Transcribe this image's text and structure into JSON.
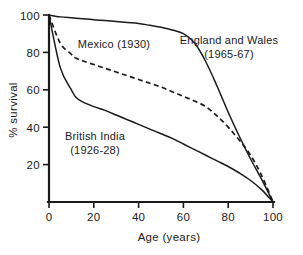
{
  "chart_data": {
    "type": "line",
    "title": "",
    "subtitle": "",
    "xlabel": "Age (years)",
    "ylabel": "% survival",
    "xlim": [
      0,
      100
    ],
    "ylim": [
      0,
      100
    ],
    "xticks": [
      "0",
      "20",
      "40",
      "60",
      "80",
      "100"
    ],
    "xtick_values": [
      0,
      20,
      40,
      60,
      80,
      100
    ],
    "yticks": [
      "20",
      "40",
      "60",
      "80",
      "100"
    ],
    "ytick_values": [
      20,
      40,
      60,
      80,
      100
    ],
    "grid": false,
    "legend_position": "inline-annotations",
    "x": [
      0,
      5,
      10,
      12,
      15,
      20,
      25,
      30,
      35,
      40,
      45,
      50,
      55,
      60,
      65,
      70,
      75,
      80,
      85,
      90,
      95,
      100
    ],
    "series": [
      {
        "name": "England and Wales (1965-67)",
        "style": "solid",
        "color": "#1a1a1a",
        "values": [
          100,
          99,
          98.5,
          98.3,
          98,
          97.5,
          97,
          96.5,
          96,
          95.5,
          94.5,
          93.5,
          92,
          90,
          85,
          75,
          62,
          48,
          35,
          23,
          12,
          0
        ]
      },
      {
        "name": "Mexico (1930)",
        "style": "dashed",
        "color": "#1a1a1a",
        "values": [
          100,
          85,
          79,
          77,
          75.5,
          73.5,
          71.5,
          69.5,
          67.5,
          65.5,
          63.5,
          61.5,
          59,
          56.5,
          54,
          51,
          46,
          40,
          33,
          25,
          14,
          0
        ]
      },
      {
        "name": "British India (1926-28)",
        "style": "solid",
        "color": "#1a1a1a",
        "values": [
          100,
          72,
          60,
          56,
          53.5,
          51,
          49,
          46.5,
          44,
          41.5,
          39,
          36.5,
          34,
          31,
          28,
          25,
          22,
          19,
          15.5,
          11.5,
          6.5,
          0
        ]
      }
    ],
    "annotations": [
      {
        "id": "mexico",
        "text_line1": "Mexico (1930)",
        "text_line2": ""
      },
      {
        "id": "england",
        "text_line1": "England and Wales",
        "text_line2": "(1965-67)"
      },
      {
        "id": "india",
        "text_line1": "British India",
        "text_line2": "(1926-28)"
      }
    ]
  }
}
